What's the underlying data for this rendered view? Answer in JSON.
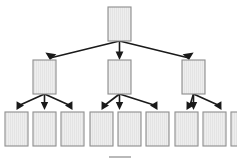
{
  "diagram": {
    "type": "tree",
    "orientation": "top-down",
    "levels": 3,
    "node_counts": [
      1,
      3,
      9
    ],
    "total_nodes": 13,
    "total_edges": 12,
    "node_label": "",
    "colors": {
      "background": "#ffffff",
      "node_fill": "#eeeeee",
      "node_stripe": "#e2e2e2",
      "node_border": "#8d8d8d",
      "edge": "#1a1a1a",
      "footer_bar": "#b9b9b9"
    },
    "nodes": [
      {
        "id": "root",
        "level": 0,
        "x": 108,
        "y": 7,
        "w": 23,
        "h": 34,
        "label": ""
      },
      {
        "id": "mid-1",
        "level": 1,
        "x": 33,
        "y": 60,
        "w": 23,
        "h": 34,
        "label": ""
      },
      {
        "id": "mid-2",
        "level": 1,
        "x": 108,
        "y": 60,
        "w": 23,
        "h": 34,
        "label": ""
      },
      {
        "id": "mid-3",
        "level": 1,
        "x": 182,
        "y": 60,
        "w": 23,
        "h": 34,
        "label": ""
      },
      {
        "id": "leaf-1",
        "level": 2,
        "x": 5,
        "y": 112,
        "w": 23,
        "h": 34,
        "label": ""
      },
      {
        "id": "leaf-2",
        "level": 2,
        "x": 33,
        "y": 112,
        "w": 23,
        "h": 34,
        "label": ""
      },
      {
        "id": "leaf-3",
        "level": 2,
        "x": 61,
        "y": 112,
        "w": 23,
        "h": 34,
        "label": ""
      },
      {
        "id": "leaf-4",
        "level": 2,
        "x": 90,
        "y": 112,
        "w": 23,
        "h": 34,
        "label": ""
      },
      {
        "id": "leaf-5",
        "level": 2,
        "x": 118,
        "y": 112,
        "w": 23,
        "h": 34,
        "label": ""
      },
      {
        "id": "leaf-6",
        "level": 2,
        "x": 146,
        "y": 112,
        "w": 23,
        "h": 34,
        "label": ""
      },
      {
        "id": "leaf-7",
        "level": 2,
        "x": 175,
        "y": 112,
        "w": 23,
        "h": 34,
        "label": ""
      },
      {
        "id": "leaf-8",
        "level": 2,
        "x": 203,
        "y": 112,
        "w": 23,
        "h": 34,
        "label": ""
      },
      {
        "id": "leaf-9",
        "level": 2,
        "x": 231,
        "y": 112,
        "w": 23,
        "h": 34,
        "label": ""
      }
    ],
    "edges": [
      {
        "from": "root",
        "to": "mid-1",
        "arrow": true
      },
      {
        "from": "root",
        "to": "mid-2",
        "arrow": true
      },
      {
        "from": "root",
        "to": "mid-3",
        "arrow": true
      },
      {
        "from": "mid-1",
        "to": "leaf-1",
        "arrow": true
      },
      {
        "from": "mid-1",
        "to": "leaf-2",
        "arrow": true
      },
      {
        "from": "mid-1",
        "to": "leaf-3",
        "arrow": true
      },
      {
        "from": "mid-2",
        "to": "leaf-4",
        "arrow": true
      },
      {
        "from": "mid-2",
        "to": "leaf-5",
        "arrow": true
      },
      {
        "from": "mid-2",
        "to": "leaf-6",
        "arrow": true
      },
      {
        "from": "mid-3",
        "to": "leaf-7",
        "arrow": true
      },
      {
        "from": "mid-3",
        "to": "leaf-8",
        "arrow": true
      },
      {
        "from": "mid-3",
        "to": "leaf-9",
        "arrow": true
      }
    ],
    "footer_mark": {
      "present": true,
      "x": 109,
      "y": 156,
      "width": 22,
      "height": 2,
      "label": ""
    }
  }
}
